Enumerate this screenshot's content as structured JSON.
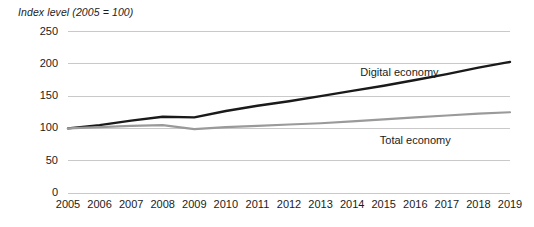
{
  "chart_data": {
    "type": "line",
    "title": "Index level (2005 = 100)",
    "xlabel": "",
    "ylabel": "Index level (2005 = 100)",
    "x": [
      2005,
      2006,
      2007,
      2008,
      2009,
      2010,
      2011,
      2012,
      2013,
      2014,
      2015,
      2016,
      2017,
      2018,
      2019
    ],
    "categories": [
      "2005",
      "2006",
      "2007",
      "2008",
      "2009",
      "2010",
      "2011",
      "2012",
      "2013",
      "2014",
      "2015",
      "2016",
      "2017",
      "2018",
      "2019"
    ],
    "yticks": [
      0,
      50,
      100,
      150,
      200,
      250
    ],
    "ytick_labels": [
      "0",
      "50",
      "100",
      "150",
      "200",
      "250"
    ],
    "ylim": [
      0,
      250
    ],
    "xlim": [
      2005,
      2019
    ],
    "grid": true,
    "legend_position": "inline-annotation",
    "series": [
      {
        "name": "Digital economy",
        "color": "#1a1a1a",
        "width": 2.4,
        "label_x": 2015.5,
        "label_y": 186,
        "values": [
          100,
          105,
          112,
          118,
          117,
          127,
          135,
          142,
          150,
          158,
          166,
          175,
          184,
          194,
          203
        ]
      },
      {
        "name": "Total economy",
        "color": "#9a9a9a",
        "width": 2.2,
        "label_x": 2016.0,
        "label_y": 80,
        "values": [
          100,
          102,
          104,
          105,
          99,
          102,
          104,
          106,
          108,
          111,
          114,
          117,
          120,
          123,
          125
        ]
      }
    ],
    "colors": {
      "digital_economy": "#1a1a1a",
      "total_economy": "#9a9a9a",
      "gridline": "#c9c9c9",
      "text": "#1b1b1b",
      "background": "#ffffff"
    },
    "geometry": {
      "plot_left": 68,
      "plot_right": 510,
      "plot_top": 31.5,
      "plot_bottom": 193,
      "ylabel_right": 58,
      "xlabel_y": 198
    }
  }
}
